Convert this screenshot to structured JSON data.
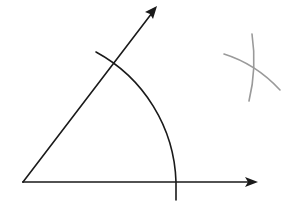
{
  "diagram": {
    "type": "geometric-construction",
    "colors": {
      "ink": "#1a1a1a",
      "construction": "#9a9a9a",
      "background": "#ffffff"
    },
    "vertex": {
      "x": 23,
      "y": 182
    },
    "rays": [
      {
        "name": "horizontal-ray",
        "from": [
          23,
          182
        ],
        "to": [
          257,
          182
        ]
      },
      {
        "name": "upper-ray",
        "from": [
          23,
          182
        ],
        "to": [
          157,
          6
        ]
      }
    ],
    "main_arc": {
      "center": [
        23,
        182
      ],
      "radius": 153,
      "start": [
        96,
        52
      ],
      "end": [
        176,
        200
      ]
    },
    "construction_arcs": [
      {
        "name": "arc-a",
        "start": [
          253,
          34
        ],
        "end": [
          249,
          101
        ]
      },
      {
        "name": "arc-b",
        "start": [
          224,
          54
        ],
        "end": [
          280,
          90
        ]
      }
    ],
    "intersection": {
      "x": 255,
      "y": 68
    }
  }
}
